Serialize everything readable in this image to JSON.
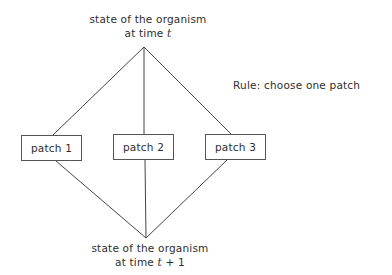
{
  "diagram": {
    "top_node": {
      "line1": "state of the organism",
      "line2_prefix": "at time ",
      "line2_var": "t",
      "line2_suffix": ""
    },
    "bottom_node": {
      "line1": "state of the organism",
      "line2_prefix": "at time ",
      "line2_var": "t",
      "line2_suffix": " + 1"
    },
    "rule": "Rule:  choose one patch",
    "patches": [
      {
        "label": "patch 1"
      },
      {
        "label": "patch 2"
      },
      {
        "label": "patch 3"
      }
    ],
    "edges": [
      {
        "from": "top_node",
        "to": "patch 1"
      },
      {
        "from": "top_node",
        "to": "patch 2"
      },
      {
        "from": "top_node",
        "to": "patch 3"
      },
      {
        "from": "patch 1",
        "to": "bottom_node"
      },
      {
        "from": "patch 2",
        "to": "bottom_node"
      },
      {
        "from": "patch 3",
        "to": "bottom_node"
      }
    ],
    "colors": {
      "text": "#2e2e2e",
      "line": "#444444",
      "box_border": "#555555",
      "background": "#ffffff"
    }
  }
}
